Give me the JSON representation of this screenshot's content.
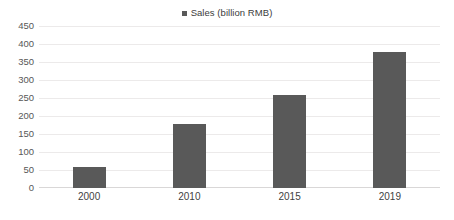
{
  "chart_data": {
    "type": "bar",
    "title": "",
    "categories": [
      "2000",
      "2010",
      "2015",
      "2019"
    ],
    "values": [
      57,
      178,
      258,
      379
    ],
    "series": [
      {
        "name": "Sales (billion RMB)",
        "values": [
          57,
          178,
          258,
          379
        ],
        "color": "#595959"
      }
    ],
    "xlabel": "",
    "ylabel": "",
    "ylim": [
      0,
      450
    ],
    "yticks": [
      0,
      50,
      100,
      150,
      200,
      250,
      300,
      350,
      400,
      450
    ],
    "ytick_labels": [
      "0",
      "50",
      "100",
      "150",
      "200",
      "250",
      "300",
      "350",
      "400",
      "450"
    ],
    "grid": true,
    "grid_axis": "y",
    "legend": {
      "position": "top-center",
      "entries": [
        {
          "label": "Sales (billion RMB)",
          "marker": "square",
          "color": "#595959"
        }
      ]
    },
    "background_color": "#ffffff",
    "gridline_color": "#eceaea",
    "axis_color": "#d9d7d7",
    "tick_label_color": "#575757"
  }
}
